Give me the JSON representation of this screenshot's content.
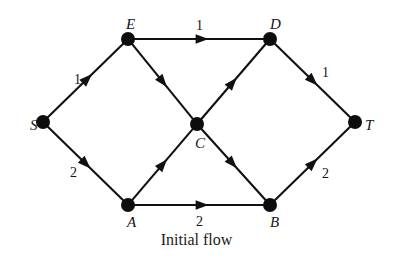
{
  "figure": {
    "caption": "Initial flow",
    "title": "Initial flow",
    "colors": {
      "background": "#ffffff",
      "node": "#0d0d0d",
      "edge": "#111111",
      "text": "#141414"
    }
  },
  "chart_data": {
    "type": "diagram",
    "diagram_kind": "directed-network-flow-graph",
    "title": "Initial flow",
    "nodes": [
      {
        "id": "S",
        "label": "S",
        "x": 43,
        "y": 122,
        "role": "source",
        "label_dx": -13,
        "label_dy": -4
      },
      {
        "id": "E",
        "label": "E",
        "x": 128,
        "y": 39,
        "role": "intermediate",
        "label_dx": -2,
        "label_dy": -22
      },
      {
        "id": "D",
        "label": "D",
        "x": 270,
        "y": 39,
        "role": "intermediate",
        "label_dx": 0,
        "label_dy": -22
      },
      {
        "id": "C",
        "label": "C",
        "x": 197,
        "y": 124,
        "role": "intermediate",
        "label_dx": -2,
        "label_dy": 12
      },
      {
        "id": "A",
        "label": "A",
        "x": 128,
        "y": 205,
        "role": "intermediate",
        "label_dx": -1,
        "label_dy": 10
      },
      {
        "id": "B",
        "label": "B",
        "x": 270,
        "y": 205,
        "role": "intermediate",
        "label_dx": 0,
        "label_dy": 10
      },
      {
        "id": "T",
        "label": "T",
        "x": 355,
        "y": 122,
        "role": "sink",
        "label_dx": 10,
        "label_dy": -4
      }
    ],
    "node_radius": 7,
    "edges": [
      {
        "from": "S",
        "to": "E",
        "flow": "1",
        "label_x": 74,
        "label_y": 73,
        "arrow_t": 0.52
      },
      {
        "from": "S",
        "to": "A",
        "flow": "2",
        "label_x": 70,
        "label_y": 166,
        "arrow_t": 0.5
      },
      {
        "from": "E",
        "to": "D",
        "flow": "1",
        "label_x": 196,
        "label_y": 19,
        "arrow_t": 0.52
      },
      {
        "from": "E",
        "to": "C",
        "flow": null,
        "label_x": null,
        "label_y": null,
        "arrow_t": 0.5
      },
      {
        "from": "C",
        "to": "D",
        "flow": null,
        "label_x": null,
        "label_y": null,
        "arrow_t": 0.48
      },
      {
        "from": "A",
        "to": "C",
        "flow": null,
        "label_x": null,
        "label_y": null,
        "arrow_t": 0.5
      },
      {
        "from": "C",
        "to": "B",
        "flow": null,
        "label_x": null,
        "label_y": null,
        "arrow_t": 0.48
      },
      {
        "from": "A",
        "to": "B",
        "flow": "2",
        "label_x": 196,
        "label_y": 215,
        "arrow_t": 0.52
      },
      {
        "from": "D",
        "to": "T",
        "flow": "1",
        "label_x": 322,
        "label_y": 66,
        "arrow_t": 0.5
      },
      {
        "from": "B",
        "to": "T",
        "flow": "2",
        "label_x": 322,
        "label_y": 167,
        "arrow_t": 0.5
      }
    ],
    "edge_labels_visible": [
      "1",
      "2",
      "1",
      "2",
      "1",
      "2"
    ],
    "source_node": "S",
    "sink_node": "T",
    "total_flow_out_of_source": 3,
    "total_flow_into_sink": 3
  }
}
